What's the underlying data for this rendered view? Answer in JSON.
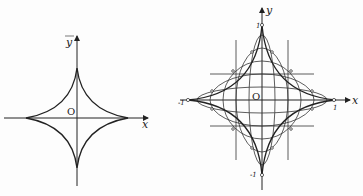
{
  "figures": [
    {
      "name": "astroid",
      "axes": {
        "x_label": "x",
        "y_label": "y",
        "origin_label": "O"
      }
    },
    {
      "name": "astroid-envelope-of-ellipses",
      "axes": {
        "x_label": "x",
        "y_label": "y",
        "origin_label": "O"
      },
      "ticks": {
        "x_neg": "-1",
        "x_pos": "1",
        "y_pos": "1",
        "y_neg": "-1"
      }
    }
  ]
}
